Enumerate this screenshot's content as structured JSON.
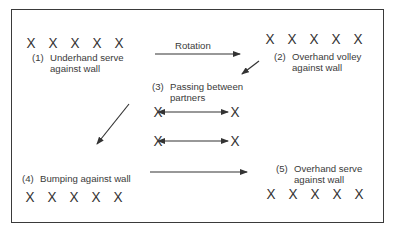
{
  "diagram": {
    "type": "drill-rotation-diagram",
    "rotation_label": "Rotation",
    "player_symbol": "X",
    "stations": [
      {
        "number": "(1)",
        "line1": "Underhand serve",
        "line2": "against wall",
        "players": 5
      },
      {
        "number": "(2)",
        "line1": "Overhand volley",
        "line2": "against wall",
        "players": 5
      },
      {
        "number": "(3)",
        "line1": "Passing between",
        "line2": "partners",
        "players": 4
      },
      {
        "number": "(4)",
        "line1": "Bumping against wall",
        "line2": "",
        "players": 5
      },
      {
        "number": "(5)",
        "line1": "Overhand serve",
        "line2": "against wall",
        "players": 5
      }
    ],
    "flow": [
      "(1) -> (2)",
      "(2) -> (3)",
      "(3) -> (4)",
      "(4) -> (5)"
    ],
    "colors": {
      "ink": "#333333",
      "background": "#ffffff"
    }
  }
}
